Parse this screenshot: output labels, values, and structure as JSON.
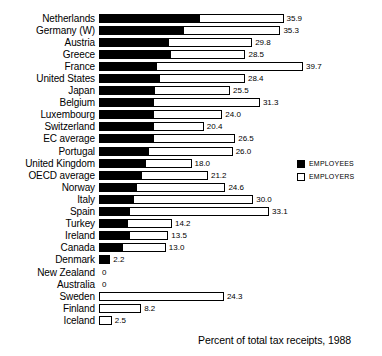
{
  "chart_data": {
    "type": "bar",
    "title": "",
    "caption": "Percent of total tax receipts, 1988",
    "xlabel": "",
    "ylabel": "",
    "xlim": [
      0,
      39.7
    ],
    "grid": false,
    "orientation": "horizontal",
    "stacked": true,
    "legend_position": "right",
    "legend": [
      {
        "name": "EMPLOYEES",
        "color": "#000000"
      },
      {
        "name": "EMPLOYERS",
        "color": "#ffffff"
      }
    ],
    "categories": [
      "Netherlands",
      "Germany (W)",
      "Austria",
      "Greece",
      "France",
      "United States",
      "Japan",
      "Belgium",
      "Luxembourg",
      "Switzerland",
      "EC average",
      "Portugal",
      "United Kingdom",
      "OECD average",
      "Norway",
      "Italy",
      "Spain",
      "Turkey",
      "Ireland",
      "Canada",
      "Denmark",
      "New Zealand",
      "Australia",
      "Sweden",
      "Finland",
      "Iceland"
    ],
    "series": [
      {
        "name": "EMPLOYEES",
        "values": [
          19.5,
          16.4,
          13.4,
          13.8,
          11.1,
          11.7,
          10.7,
          10.5,
          10.5,
          10.5,
          10.5,
          9.6,
          9.0,
          8.2,
          7.2,
          6.6,
          5.8,
          5.5,
          5.8,
          4.5,
          2.2,
          0,
          0,
          0,
          0,
          0
        ]
      },
      {
        "name": "EMPLOYERS",
        "values": [
          16.4,
          18.9,
          16.4,
          14.7,
          28.6,
          16.7,
          14.8,
          20.8,
          13.5,
          9.9,
          16.0,
          16.4,
          9.0,
          13.0,
          17.4,
          23.4,
          27.3,
          8.7,
          7.7,
          8.5,
          0,
          0,
          0,
          24.3,
          8.2,
          2.5
        ]
      }
    ],
    "totals": [
      35.9,
      35.3,
      29.8,
      28.5,
      39.7,
      28.4,
      25.5,
      31.3,
      24.0,
      20.4,
      26.5,
      26.0,
      18.0,
      21.2,
      24.6,
      30.0,
      33.1,
      14.2,
      13.5,
      13.0,
      2.2,
      0,
      0,
      24.3,
      8.2,
      2.5
    ],
    "value_labels": [
      "35.9",
      "35.3",
      "29.8",
      "28.5",
      "39.7",
      "28.4",
      "25.5",
      "31.3",
      "24.0",
      "20.4",
      "26.5",
      "26.0",
      "18.0",
      "21.2",
      "24.6",
      "30.0",
      "33.1",
      "14.2",
      "13.5",
      "13.0",
      "2.2",
      "0",
      "0",
      "24.3",
      "8.2",
      "2.5"
    ]
  }
}
